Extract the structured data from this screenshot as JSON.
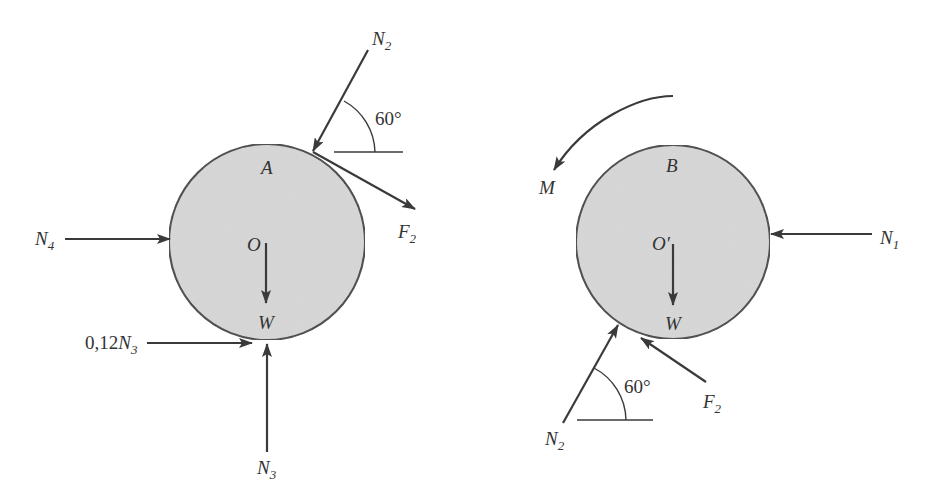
{
  "figure": {
    "colors": {
      "disc_fill": "#d8d8d8",
      "ink": "#3a3a3a",
      "background": "#ffffff"
    }
  },
  "disc_a": {
    "name": "A",
    "center_label": "O",
    "weight_label": "W",
    "forces": {
      "n2": {
        "main": "N",
        "sub": "2"
      },
      "f2": {
        "main": "F",
        "sub": "2"
      },
      "n4": {
        "main": "N",
        "sub": "4"
      },
      "n3": {
        "main": "N",
        "sub": "3"
      },
      "friction": {
        "prefix": "0,12",
        "main": "N",
        "sub": "3"
      }
    },
    "angle_label": "60°"
  },
  "disc_b": {
    "name": "B",
    "center_label": "O′",
    "weight_label": "W",
    "moment_label": "M",
    "forces": {
      "n1": {
        "main": "N",
        "sub": "1"
      },
      "n2": {
        "main": "N",
        "sub": "2"
      },
      "f2": {
        "main": "F",
        "sub": "2"
      }
    },
    "angle_label": "60°"
  }
}
